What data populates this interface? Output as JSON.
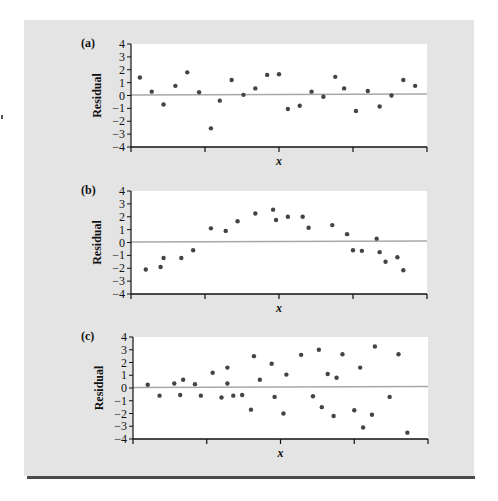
{
  "figure": {
    "background_color": "#e4e4e4",
    "plot_background": "#ffffff",
    "zero_line_color": "#a8a8a8",
    "point_color": "#444444",
    "axis_color": "#111111",
    "rule_color": "#4a4a4a"
  },
  "chart_data": [
    {
      "type": "scatter",
      "panel_label": "(a)",
      "title": "",
      "xlabel": "x",
      "ylabel": "Residual",
      "ylim": [
        -4,
        4
      ],
      "xlim": [
        0,
        100
      ],
      "yticks": [
        "4",
        "3",
        "2",
        "1",
        "0",
        "−1",
        "−2",
        "−3",
        "−4"
      ],
      "xticks_count": 5,
      "x_tick_labels": [],
      "reference_line": 0,
      "grid": false,
      "points": [
        {
          "x": 3,
          "y": 1.4
        },
        {
          "x": 7,
          "y": 0.3
        },
        {
          "x": 11,
          "y": -0.7
        },
        {
          "x": 15,
          "y": 0.75
        },
        {
          "x": 19,
          "y": 1.8
        },
        {
          "x": 23,
          "y": 0.25
        },
        {
          "x": 27,
          "y": -2.55
        },
        {
          "x": 30,
          "y": -0.4
        },
        {
          "x": 34,
          "y": 1.2
        },
        {
          "x": 38,
          "y": 0.05
        },
        {
          "x": 42,
          "y": 0.55
        },
        {
          "x": 46,
          "y": 1.6
        },
        {
          "x": 50,
          "y": 1.65
        },
        {
          "x": 53,
          "y": -1.05
        },
        {
          "x": 57,
          "y": -0.8
        },
        {
          "x": 61,
          "y": 0.3
        },
        {
          "x": 65,
          "y": -0.1
        },
        {
          "x": 69,
          "y": 1.45
        },
        {
          "x": 72,
          "y": 0.55
        },
        {
          "x": 76,
          "y": -1.2
        },
        {
          "x": 80,
          "y": 0.35
        },
        {
          "x": 84,
          "y": -0.85
        },
        {
          "x": 88,
          "y": 0.0
        },
        {
          "x": 92,
          "y": 1.2
        },
        {
          "x": 96,
          "y": 0.75
        }
      ]
    },
    {
      "type": "scatter",
      "panel_label": "(b)",
      "title": "",
      "xlabel": "x",
      "ylabel": "Residual",
      "ylim": [
        -4,
        4
      ],
      "xlim": [
        0,
        100
      ],
      "yticks": [
        "4",
        "3",
        "2",
        "1",
        "0",
        "−1",
        "−2",
        "−3",
        "−4"
      ],
      "xticks_count": 5,
      "x_tick_labels": [],
      "reference_line": 0,
      "grid": false,
      "points": [
        {
          "x": 5,
          "y": -2.1
        },
        {
          "x": 10,
          "y": -1.9
        },
        {
          "x": 11,
          "y": -1.2
        },
        {
          "x": 17,
          "y": -1.2
        },
        {
          "x": 21,
          "y": -0.6
        },
        {
          "x": 27,
          "y": 1.1
        },
        {
          "x": 32,
          "y": 0.9
        },
        {
          "x": 36,
          "y": 1.65
        },
        {
          "x": 42,
          "y": 2.25
        },
        {
          "x": 48,
          "y": 2.55
        },
        {
          "x": 49,
          "y": 1.75
        },
        {
          "x": 53,
          "y": 2.0
        },
        {
          "x": 58,
          "y": 2.0
        },
        {
          "x": 60,
          "y": 1.15
        },
        {
          "x": 68,
          "y": 1.35
        },
        {
          "x": 73,
          "y": 0.65
        },
        {
          "x": 75,
          "y": -0.6
        },
        {
          "x": 78,
          "y": -0.65
        },
        {
          "x": 83,
          "y": 0.3
        },
        {
          "x": 84,
          "y": -0.75
        },
        {
          "x": 86,
          "y": -1.5
        },
        {
          "x": 90,
          "y": -1.15
        },
        {
          "x": 92,
          "y": -2.15
        }
      ]
    },
    {
      "type": "scatter",
      "panel_label": "(c)",
      "title": "",
      "xlabel": "x",
      "ylabel": "Residual",
      "ylim": [
        -4,
        4
      ],
      "xlim": [
        0,
        100
      ],
      "yticks": [
        "4",
        "3",
        "2",
        "1",
        "0",
        "−1",
        "−2",
        "−3",
        "−4"
      ],
      "xticks_count": 5,
      "x_tick_labels": [],
      "reference_line": 0,
      "grid": false,
      "points": [
        {
          "x": 5,
          "y": 0.25
        },
        {
          "x": 9,
          "y": -0.6
        },
        {
          "x": 14,
          "y": 0.35
        },
        {
          "x": 16,
          "y": -0.55
        },
        {
          "x": 17,
          "y": 0.65
        },
        {
          "x": 21,
          "y": 0.3
        },
        {
          "x": 23,
          "y": -0.6
        },
        {
          "x": 27,
          "y": 1.2
        },
        {
          "x": 30,
          "y": -0.75
        },
        {
          "x": 32,
          "y": 1.6
        },
        {
          "x": 32,
          "y": 0.35
        },
        {
          "x": 34,
          "y": -0.6
        },
        {
          "x": 37,
          "y": -0.55
        },
        {
          "x": 40,
          "y": -1.7
        },
        {
          "x": 41,
          "y": 2.5
        },
        {
          "x": 43,
          "y": 0.65
        },
        {
          "x": 47,
          "y": 1.9
        },
        {
          "x": 48,
          "y": -0.7
        },
        {
          "x": 51,
          "y": -2.0
        },
        {
          "x": 52,
          "y": 1.05
        },
        {
          "x": 57,
          "y": 2.6
        },
        {
          "x": 61,
          "y": -0.65
        },
        {
          "x": 63,
          "y": 3.0
        },
        {
          "x": 64,
          "y": -1.5
        },
        {
          "x": 66,
          "y": 1.1
        },
        {
          "x": 68,
          "y": -2.2
        },
        {
          "x": 69,
          "y": 0.8
        },
        {
          "x": 71,
          "y": 2.65
        },
        {
          "x": 75,
          "y": -1.75
        },
        {
          "x": 77,
          "y": 1.6
        },
        {
          "x": 78,
          "y": -3.1
        },
        {
          "x": 81,
          "y": -2.1
        },
        {
          "x": 82,
          "y": 3.25
        },
        {
          "x": 87,
          "y": -0.7
        },
        {
          "x": 90,
          "y": 2.65
        },
        {
          "x": 93,
          "y": -3.5
        }
      ]
    }
  ]
}
